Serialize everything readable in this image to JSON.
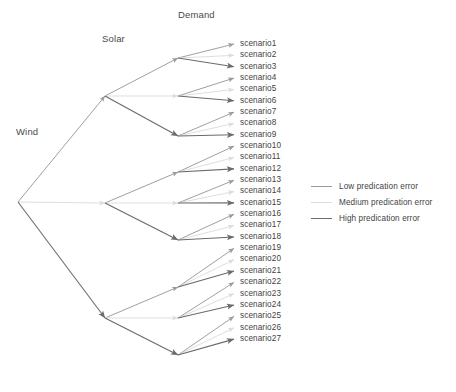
{
  "figure": {
    "type": "scenario-tree",
    "stage_labels": {
      "wind": "Wind",
      "solar": "Solar",
      "demand": "Demand"
    }
  },
  "legend": {
    "items": [
      {
        "label": "Low predication error",
        "color": "#9a9a9a",
        "level": "low"
      },
      {
        "label": "Medium predication error",
        "color": "#dcdcdc",
        "level": "medium"
      },
      {
        "label": "High predication error",
        "color": "#6b6b6b",
        "level": "high"
      }
    ]
  },
  "colors": {
    "low": "#9a9a9a",
    "medium": "#dcdcdc",
    "high": "#6b6b6b",
    "background": "#ffffff",
    "text": "#3f3f3f"
  },
  "tree": {
    "root": {
      "id": "wind-root",
      "x": 18,
      "y": 202
    },
    "level1": [
      {
        "id": "solar-high-branch",
        "x": 105,
        "y": 96,
        "edge_level": "low"
      },
      {
        "id": "solar-mid-branch",
        "x": 105,
        "y": 203,
        "edge_level": "medium"
      },
      {
        "id": "solar-low-branch",
        "x": 105,
        "y": 318,
        "edge_level": "high"
      }
    ],
    "level2": [
      {
        "id": "demand-node-1",
        "x": 178,
        "y": 58,
        "parent": 0,
        "edge_level": "low"
      },
      {
        "id": "demand-node-2",
        "x": 178,
        "y": 96,
        "parent": 0,
        "edge_level": "medium"
      },
      {
        "id": "demand-node-3",
        "x": 178,
        "y": 136,
        "parent": 0,
        "edge_level": "high"
      },
      {
        "id": "demand-node-4",
        "x": 178,
        "y": 172,
        "parent": 1,
        "edge_level": "low"
      },
      {
        "id": "demand-node-5",
        "x": 178,
        "y": 203,
        "parent": 1,
        "edge_level": "medium"
      },
      {
        "id": "demand-node-6",
        "x": 178,
        "y": 240,
        "parent": 1,
        "edge_level": "high"
      },
      {
        "id": "demand-node-7",
        "x": 178,
        "y": 287,
        "parent": 2,
        "edge_level": "low"
      },
      {
        "id": "demand-node-8",
        "x": 178,
        "y": 318,
        "parent": 2,
        "edge_level": "medium"
      },
      {
        "id": "demand-node-9",
        "x": 178,
        "y": 355,
        "parent": 2,
        "edge_level": "high"
      }
    ],
    "leaf_x": 234,
    "leaf_first_y": 44,
    "leaf_spacing": 11.35
  },
  "scenarios": [
    {
      "name": "scenario1",
      "parent": 0,
      "edge_level": "low"
    },
    {
      "name": "scenario2",
      "parent": 0,
      "edge_level": "medium"
    },
    {
      "name": "scenario3",
      "parent": 0,
      "edge_level": "high"
    },
    {
      "name": "scenario4",
      "parent": 1,
      "edge_level": "low"
    },
    {
      "name": "scenario5",
      "parent": 1,
      "edge_level": "medium"
    },
    {
      "name": "scenario6",
      "parent": 1,
      "edge_level": "high"
    },
    {
      "name": "scenario7",
      "parent": 2,
      "edge_level": "low"
    },
    {
      "name": "scenario8",
      "parent": 2,
      "edge_level": "medium"
    },
    {
      "name": "scenario9",
      "parent": 2,
      "edge_level": "high"
    },
    {
      "name": "scenario10",
      "parent": 3,
      "edge_level": "low"
    },
    {
      "name": "scenario11",
      "parent": 3,
      "edge_level": "medium"
    },
    {
      "name": "scenario12",
      "parent": 3,
      "edge_level": "high"
    },
    {
      "name": "scenario13",
      "parent": 4,
      "edge_level": "low"
    },
    {
      "name": "scenario14",
      "parent": 4,
      "edge_level": "medium"
    },
    {
      "name": "scenario15",
      "parent": 4,
      "edge_level": "high"
    },
    {
      "name": "scenario16",
      "parent": 5,
      "edge_level": "low"
    },
    {
      "name": "scenario17",
      "parent": 5,
      "edge_level": "medium"
    },
    {
      "name": "scenario18",
      "parent": 5,
      "edge_level": "high"
    },
    {
      "name": "scenario19",
      "parent": 6,
      "edge_level": "low"
    },
    {
      "name": "scenario20",
      "parent": 6,
      "edge_level": "medium"
    },
    {
      "name": "scenario21",
      "parent": 6,
      "edge_level": "high"
    },
    {
      "name": "scenario22",
      "parent": 7,
      "edge_level": "low"
    },
    {
      "name": "scenario23",
      "parent": 7,
      "edge_level": "medium"
    },
    {
      "name": "scenario24",
      "parent": 7,
      "edge_level": "high"
    },
    {
      "name": "scenario25",
      "parent": 8,
      "edge_level": "low"
    },
    {
      "name": "scenario26",
      "parent": 8,
      "edge_level": "medium"
    },
    {
      "name": "scenario27",
      "parent": 8,
      "edge_level": "high"
    }
  ]
}
